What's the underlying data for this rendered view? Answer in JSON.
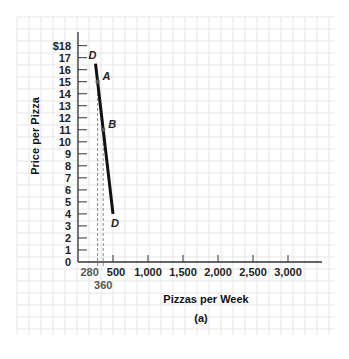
{
  "chart_data": {
    "type": "line",
    "title": "",
    "subtitle": "(a)",
    "xlabel": "Pizzas per Week",
    "ylabel": "Price per Pizza",
    "xlim": [
      0,
      3500
    ],
    "ylim": [
      0,
      18
    ],
    "grid": true,
    "x_ticks": [
      500,
      1000,
      1500,
      2000,
      2500,
      3000
    ],
    "x_tick_labels": [
      "500",
      "1,000",
      "1,500",
      "2,000",
      "2,500",
      "3,000"
    ],
    "x_extra_labels": [
      {
        "value": 280,
        "label": "280"
      },
      {
        "value": 360,
        "label": "360"
      }
    ],
    "y_ticks": [
      0,
      1,
      2,
      3,
      4,
      5,
      6,
      7,
      8,
      9,
      10,
      11,
      12,
      13,
      14,
      15,
      16,
      17,
      18
    ],
    "y_tick_labels": [
      "0",
      "1",
      "2",
      "3",
      "4",
      "5",
      "6",
      "7",
      "8",
      "9",
      "10",
      "11",
      "12",
      "13",
      "14",
      "15",
      "16",
      "17",
      "$18"
    ],
    "series": [
      {
        "name": "D",
        "label_start": "D",
        "label_end": "D",
        "x": [
          250,
          280,
          360,
          500
        ],
        "y": [
          16.5,
          15,
          11,
          4
        ]
      }
    ],
    "points": [
      {
        "name": "A",
        "x": 280,
        "y": 15
      },
      {
        "name": "B",
        "x": 360,
        "y": 11
      }
    ],
    "reference_lines": [
      {
        "type": "vertical-dashed",
        "x": 280,
        "from_y": 0,
        "to_y": 15
      },
      {
        "type": "vertical-dashed",
        "x": 360,
        "from_y": 0,
        "to_y": 11
      }
    ]
  },
  "colors": {
    "grid": "#e6e6e6",
    "axis": "#333333",
    "curve": "#111111",
    "dashed": "#888888",
    "point": "#555555"
  }
}
